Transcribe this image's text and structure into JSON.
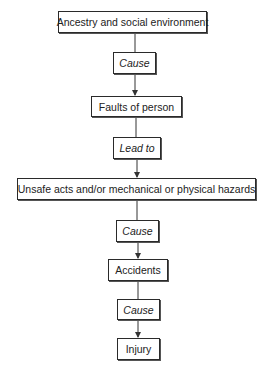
{
  "diagram": {
    "type": "flowchart",
    "direction": "top-to-bottom",
    "nodes": [
      {
        "id": "ancestry",
        "label": "Ancestry and social environment",
        "kind": "factor"
      },
      {
        "id": "cause1",
        "label": "Cause",
        "kind": "relation"
      },
      {
        "id": "faults",
        "label": "Faults of person",
        "kind": "factor"
      },
      {
        "id": "leadto",
        "label": "Lead to",
        "kind": "relation"
      },
      {
        "id": "unsafe",
        "label": "Unsafe acts and/or mechanical or physical hazards",
        "kind": "factor"
      },
      {
        "id": "cause2",
        "label": "Cause",
        "kind": "relation"
      },
      {
        "id": "accidents",
        "label": "Accidents",
        "kind": "factor"
      },
      {
        "id": "cause3",
        "label": "Cause",
        "kind": "relation"
      },
      {
        "id": "injury",
        "label": "Injury",
        "kind": "factor"
      }
    ],
    "edges": [
      [
        "ancestry",
        "cause1"
      ],
      [
        "cause1",
        "faults"
      ],
      [
        "faults",
        "leadto"
      ],
      [
        "leadto",
        "unsafe"
      ],
      [
        "unsafe",
        "cause2"
      ],
      [
        "cause2",
        "accidents"
      ],
      [
        "accidents",
        "cause3"
      ],
      [
        "cause3",
        "injury"
      ]
    ]
  }
}
